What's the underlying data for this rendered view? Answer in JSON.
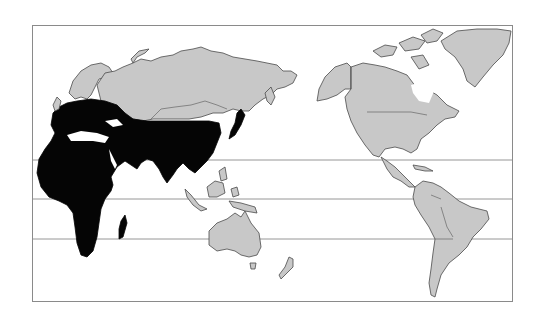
{
  "map": {
    "type": "world distribution map (Pacific-centered projection)",
    "legend": {
      "highlighted_region_color": "#050505",
      "other_land_color": "#c8c8c8",
      "ocean_color": "#ffffff"
    },
    "highlighted_regions": [
      "Southern Europe",
      "Africa",
      "Middle East",
      "Arabian Peninsula",
      "South Asia",
      "Southern China",
      "Japan",
      "Madagascar"
    ],
    "unhighlighted_regions": [
      "Northern Europe",
      "Russia",
      "Mongolia",
      "Northern China",
      "Southeast Asia islands",
      "Australia",
      "New Zealand",
      "North America",
      "Greenland",
      "Central America",
      "South America"
    ],
    "reference_lines": [
      "Tropic of Cancer",
      "Equator",
      "Tropic of Capricorn"
    ]
  }
}
